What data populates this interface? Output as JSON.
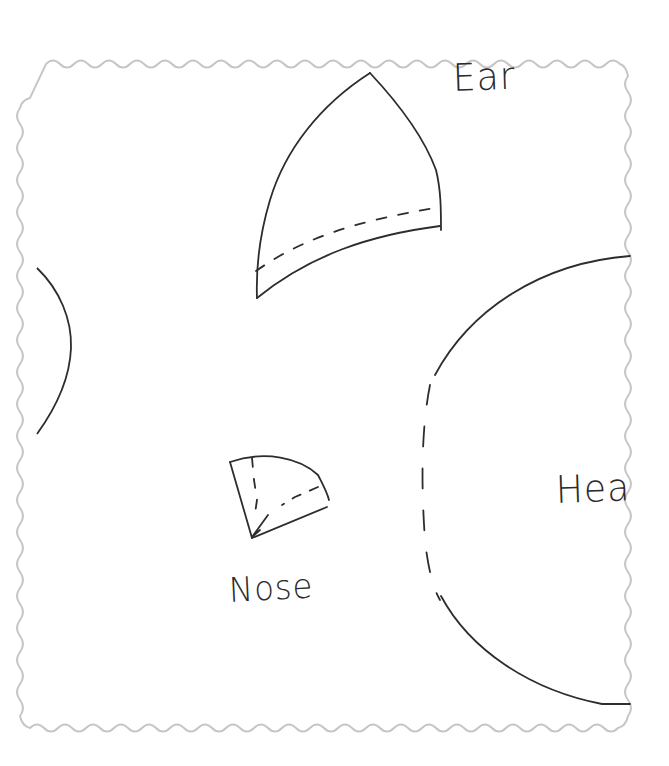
{
  "page": {
    "border_color": "#c6c6c6",
    "stroke_color": "#2d2d2d",
    "background": "#ffffff"
  },
  "pieces": [
    {
      "id": "ear",
      "label": "Ear",
      "has_fold_line": true
    },
    {
      "id": "nose",
      "label": "Nose",
      "has_fold_line": true
    },
    {
      "id": "head",
      "label": "Hea",
      "label_truncated_from": "Head",
      "has_dashed_edge": true
    },
    {
      "id": "left-partial",
      "label": ""
    }
  ]
}
